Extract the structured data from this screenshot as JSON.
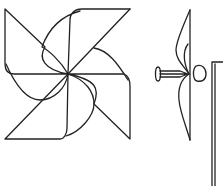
{
  "diagram": {
    "views": [
      {
        "name": "front-view",
        "description": "four-blade pinwheel, front"
      },
      {
        "name": "side-view",
        "description": "pinwheel side profile with pin and stick"
      }
    ],
    "colors": {
      "stroke": "#222222",
      "background": "#ffffff"
    }
  }
}
